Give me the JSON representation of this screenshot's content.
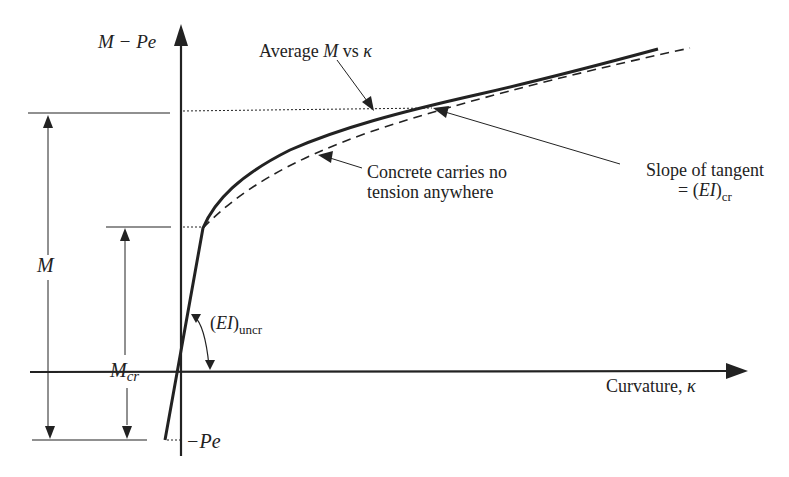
{
  "figure": {
    "y_axis_label": {
      "main": "M − Pe"
    },
    "x_axis_label": {
      "text": "Curvature, ",
      "symbol": "κ"
    },
    "annotations": {
      "average": {
        "prefix": "Average ",
        "var": "M",
        "suffix": " vs ",
        "symbol": "κ"
      },
      "no_tension": {
        "line1": "Concrete carries no",
        "line2": "tension anywhere"
      },
      "tangent": {
        "line1": "Slope of tangent",
        "line2_prefix": "= (",
        "line2_var": "EI",
        "line2_close": ")",
        "line2_sub": "cr"
      },
      "uncracked": {
        "open": "(",
        "var": "EI",
        "close": ")",
        "sub": "uncr"
      }
    },
    "dimensions": {
      "M": "M",
      "Mcr_main": "M",
      "Mcr_sub": "cr",
      "neg_Pe": "−Pe"
    },
    "colors": {
      "ink": "#222222",
      "background": "#ffffff"
    }
  }
}
